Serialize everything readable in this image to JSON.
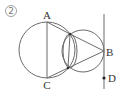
{
  "problem": {
    "number_label": "②"
  },
  "points": {
    "A": {
      "label": "A"
    },
    "B": {
      "label": "B"
    },
    "C": {
      "label": "C"
    },
    "D": {
      "label": "D"
    }
  },
  "colors": {
    "stroke": "#6b6b6b",
    "text": "#333333"
  }
}
